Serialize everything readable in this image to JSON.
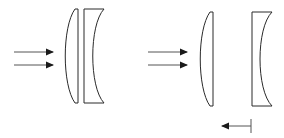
{
  "diagram": {
    "colors": {
      "line": "#2a2a2a",
      "background": "#ffffff"
    },
    "groups": [
      {
        "id": "left-configuration",
        "incoming_rays": 2,
        "elements": [
          "plano-convex-lens",
          "plano-concave-lens"
        ],
        "state": "lenses in contact"
      },
      {
        "id": "right-configuration",
        "incoming_rays": 2,
        "elements": [
          "plano-convex-lens",
          "plano-concave-lens"
        ],
        "state": "lenses separated",
        "motion_arrow": "left"
      }
    ]
  }
}
